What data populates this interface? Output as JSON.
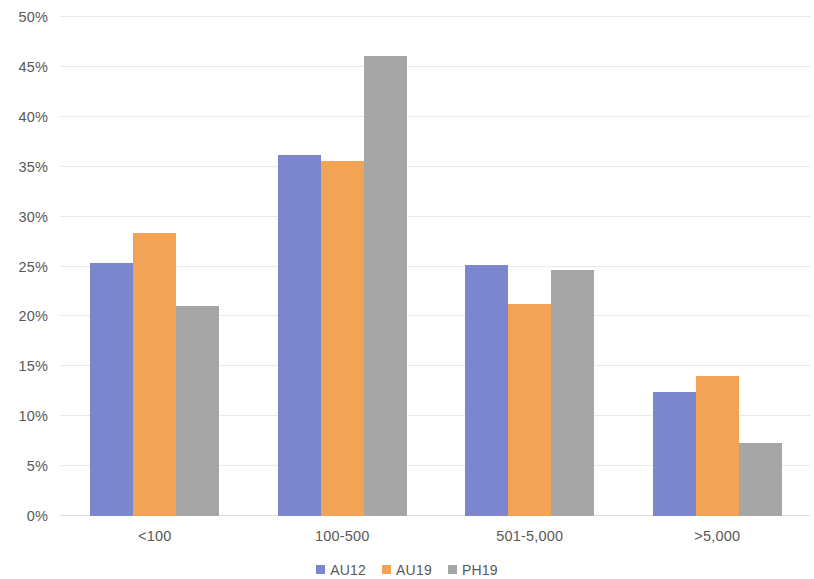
{
  "chart_data": {
    "type": "bar",
    "title": "",
    "subtitle": "",
    "xlabel": "",
    "ylabel": "",
    "categories": [
      "<100",
      "100-500",
      "501-5,000",
      ">5,000"
    ],
    "series": [
      {
        "name": "AU12",
        "color": "#7b86ce",
        "values": [
          25.4,
          36.2,
          25.2,
          12.4
        ]
      },
      {
        "name": "AU19",
        "color": "#f3a356",
        "values": [
          28.4,
          35.6,
          21.2,
          14.0
        ]
      },
      {
        "name": "PH19",
        "color": "#a6a6a6",
        "values": [
          21.0,
          46.1,
          24.7,
          7.3
        ]
      }
    ],
    "ylim": [
      0,
      50
    ],
    "ytick_values": [
      0,
      5,
      10,
      15,
      20,
      25,
      30,
      35,
      40,
      45,
      50
    ],
    "ytick_labels": [
      "0%",
      "5%",
      "10%",
      "15%",
      "20%",
      "25%",
      "30%",
      "35%",
      "40%",
      "45%",
      "50%"
    ],
    "grid": true,
    "grid_color": "#e9e9e9",
    "legend_position": "bottom",
    "legend": [
      "AU12",
      "AU19",
      "PH19"
    ],
    "axis_text_color": "#595959",
    "background_color": "#ffffff"
  }
}
